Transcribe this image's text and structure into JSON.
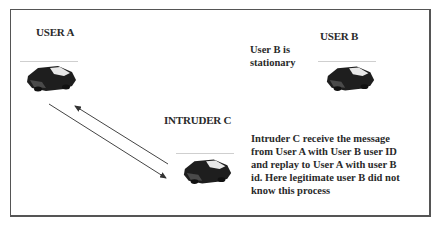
{
  "diagram": {
    "type": "replay-attack-scenario",
    "nodes": {
      "user_a": {
        "label": "USER A",
        "icon": "car-icon"
      },
      "user_b": {
        "label": "USER B",
        "icon": "car-icon",
        "note": "User B is stationary"
      },
      "intruder_c": {
        "label": "INTRUDER C",
        "icon": "car-icon"
      }
    },
    "note_user_b_line1": "User B is",
    "note_user_b_line2": "stationary",
    "description_lines": [
      "Intruder C  receive the message",
      "from User A with User B user ID",
      "and replay to User A with  user B",
      "id. Here legitimate user B did not",
      "know this process"
    ],
    "edges": [
      {
        "from": "user_a",
        "to": "intruder_c",
        "style": "arrow"
      },
      {
        "from": "intruder_c",
        "to": "user_a",
        "style": "arrow"
      }
    ],
    "colors": {
      "border": "#555555",
      "text": "#2a2a2a",
      "car": "#1e1e1e",
      "arrow": "#333333"
    }
  }
}
